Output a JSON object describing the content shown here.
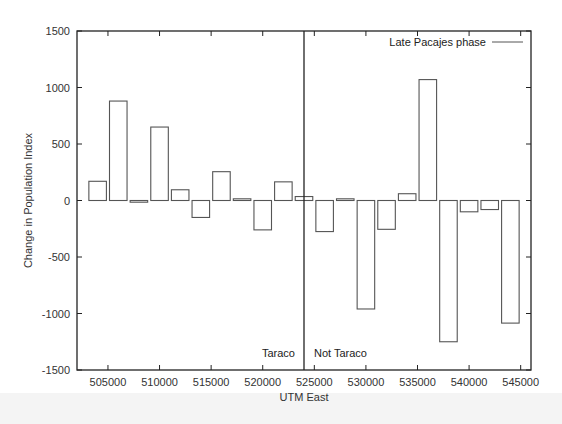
{
  "chart_data": {
    "type": "bar",
    "title": "",
    "xlabel": "UTM East",
    "ylabel": "Change in Population Index",
    "xlim": [
      502000,
      546000
    ],
    "ylim": [
      -1500,
      1500
    ],
    "xticks": [
      505000,
      510000,
      515000,
      520000,
      525000,
      530000,
      535000,
      540000,
      545000
    ],
    "xtick_labels": [
      "505000",
      "510000",
      "515000",
      "520000",
      "525000",
      "530000",
      "535000",
      "540000",
      "545000"
    ],
    "yticks": [
      -1500,
      -1000,
      -500,
      0,
      500,
      1000,
      1500
    ],
    "ytick_labels": [
      "-1500",
      "-1000",
      "-500",
      "0",
      "500",
      "1000",
      "1500"
    ],
    "bar_width": 1700,
    "grid": false,
    "legend": {
      "placement": "top-right",
      "entries": [
        {
          "label": "Late Pacajes phase"
        }
      ]
    },
    "series": [
      {
        "name": "Late Pacajes phase",
        "x": [
          504000,
          506000,
          508000,
          510000,
          512000,
          514000,
          516000,
          518000,
          520000,
          522000,
          524000,
          526000,
          528000,
          530000,
          532000,
          534000,
          536000,
          538000,
          540000,
          542000,
          544000
        ],
        "values": [
          170,
          880,
          -15,
          650,
          95,
          -150,
          255,
          15,
          -260,
          165,
          35,
          -275,
          15,
          -960,
          -255,
          60,
          1070,
          -1250,
          -100,
          -80,
          -1085
        ]
      }
    ],
    "divider": {
      "x": 524000
    },
    "annotations": [
      {
        "text": "Taraco",
        "x": 523500,
        "y": -1350,
        "align": "right"
      },
      {
        "text": "Not Taraco",
        "x": 525000,
        "y": -1350,
        "align": "left"
      }
    ],
    "colors": {
      "bar_stroke": "#555555",
      "axis": "#222222",
      "bar_fill": "#ffffff"
    }
  }
}
